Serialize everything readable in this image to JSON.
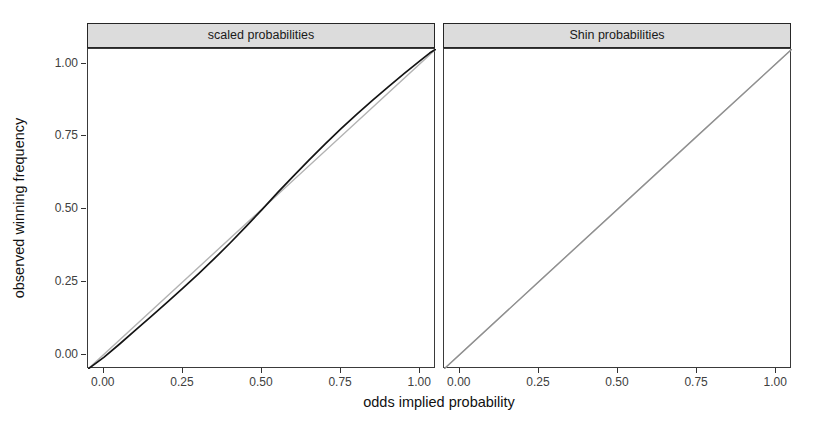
{
  "chart_data": {
    "type": "line",
    "title": "",
    "xlabel": "odds implied probability",
    "ylabel": "observed winning frequency",
    "xlim": [
      -0.05,
      1.05
    ],
    "ylim": [
      -0.05,
      1.05
    ],
    "grid": false,
    "legend": "none",
    "x_ticks": {
      "values": [
        0.0,
        0.25,
        0.5,
        0.75,
        1.0
      ],
      "labels": [
        "0.00",
        "0.25",
        "0.50",
        "0.75",
        "1.00"
      ]
    },
    "y_ticks": {
      "values": [
        0.0,
        0.25,
        0.5,
        0.75,
        1.0
      ],
      "labels": [
        "0.00",
        "0.25",
        "0.50",
        "0.75",
        "1.00"
      ]
    },
    "facets": [
      {
        "label": "scaled probabilities",
        "series": [
          {
            "name": "identity-reference-line",
            "color": "#b3b3b3",
            "width": 1.4,
            "points": [
              [
                -0.05,
                -0.05
              ],
              [
                1.05,
                1.05
              ]
            ]
          },
          {
            "name": "calibration-curve",
            "color": "#141414",
            "width": 1.7,
            "points": [
              [
                -0.05,
                -0.05
              ],
              [
                0.0,
                -0.01
              ],
              [
                0.05,
                0.036
              ],
              [
                0.1,
                0.084
              ],
              [
                0.15,
                0.131
              ],
              [
                0.2,
                0.179
              ],
              [
                0.25,
                0.228
              ],
              [
                0.3,
                0.278
              ],
              [
                0.35,
                0.33
              ],
              [
                0.4,
                0.384
              ],
              [
                0.45,
                0.44
              ],
              [
                0.5,
                0.498
              ],
              [
                0.55,
                0.557
              ],
              [
                0.6,
                0.614
              ],
              [
                0.65,
                0.67
              ],
              [
                0.7,
                0.724
              ],
              [
                0.75,
                0.776
              ],
              [
                0.8,
                0.826
              ],
              [
                0.85,
                0.874
              ],
              [
                0.9,
                0.921
              ],
              [
                0.95,
                0.966
              ],
              [
                1.0,
                1.01
              ],
              [
                1.03,
                1.036
              ],
              [
                1.05,
                1.05
              ]
            ]
          }
        ]
      },
      {
        "label": "Shin probabilities",
        "series": [
          {
            "name": "identity-reference-line",
            "color": "#b3b3b3",
            "width": 1.4,
            "points": [
              [
                -0.05,
                -0.05
              ],
              [
                1.05,
                1.05
              ]
            ]
          },
          {
            "name": "calibration-curve",
            "color": "#8f8f8f",
            "width": 1.2,
            "points": [
              [
                -0.05,
                -0.05
              ],
              [
                0.0,
                0.0
              ],
              [
                0.25,
                0.251
              ],
              [
                0.5,
                0.501
              ],
              [
                0.75,
                0.751
              ],
              [
                1.0,
                1.0
              ],
              [
                1.05,
                1.05
              ]
            ]
          }
        ]
      }
    ]
  }
}
